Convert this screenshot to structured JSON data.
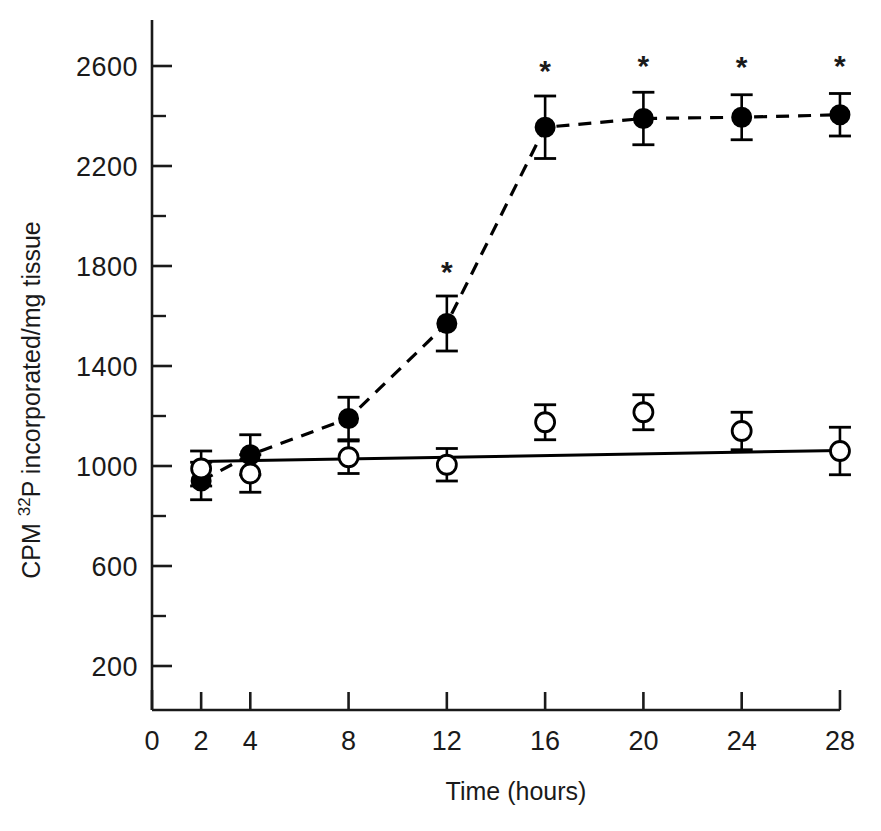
{
  "chart_data": {
    "type": "line",
    "title": "",
    "xlabel": "Time (hours)",
    "ylabel": "CPM 32P incorporated/mg tissue",
    "ylabel_parts": {
      "prefix": "CPM ",
      "superscript": "32",
      "middle": "P incorporated/mg tissue"
    },
    "xlim": [
      0,
      28
    ],
    "ylim": [
      0,
      2800
    ],
    "xticks": [
      0,
      2,
      4,
      8,
      12,
      16,
      20,
      24,
      28
    ],
    "xtick_labels": [
      "0",
      "2",
      "4",
      "8",
      "12",
      "16",
      "20",
      "24",
      "28"
    ],
    "yticks": [
      200,
      600,
      1000,
      1400,
      1800,
      2200,
      2600
    ],
    "ytick_labels": [
      "200",
      "600",
      "1000",
      "1400",
      "1800",
      "2200",
      "2600"
    ],
    "yminor_ticks": [
      0,
      400,
      800,
      1200,
      1600,
      2000,
      2400,
      2800
    ],
    "grid": false,
    "legend_position": "none",
    "x": [
      2,
      4,
      8,
      12,
      16,
      20,
      24,
      28
    ],
    "series": [
      {
        "name": "filled-circle-series",
        "marker": "filled-circle",
        "line_style": "dashed",
        "color": "#000000",
        "values": [
          940,
          1045,
          1190,
          1570,
          2355,
          2390,
          2395,
          2405
        ],
        "error_bars": [
          75,
          80,
          85,
          110,
          125,
          105,
          90,
          85
        ],
        "significance": [
          false,
          false,
          false,
          true,
          true,
          true,
          true,
          true
        ],
        "significance_marker": "*"
      },
      {
        "name": "open-circle-series",
        "marker": "open-circle",
        "line_style": "solid",
        "color": "#000000",
        "values": [
          990,
          970,
          1035,
          1005,
          1175,
          1215,
          1140,
          1060
        ],
        "error_bars": [
          70,
          75,
          65,
          65,
          70,
          70,
          75,
          95
        ],
        "significance": [
          false,
          false,
          false,
          false,
          false,
          false,
          false,
          false
        ]
      }
    ],
    "trend_line": {
      "name": "control-regression-line",
      "x_start": 2,
      "y_start": 1018,
      "x_end": 28,
      "y_end": 1062
    },
    "annotations": [
      {
        "label": "*",
        "x": 12,
        "y": 1735
      },
      {
        "label": "*",
        "x": 16,
        "y": 2540
      },
      {
        "label": "*",
        "x": 20,
        "y": 2560
      },
      {
        "label": "*",
        "x": 24,
        "y": 2555
      },
      {
        "label": "*",
        "x": 28,
        "y": 2560
      }
    ]
  }
}
